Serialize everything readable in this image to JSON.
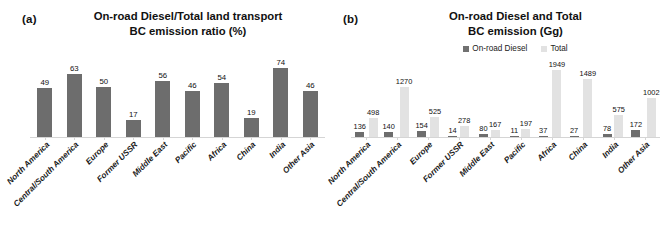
{
  "figure": {
    "panels": [
      {
        "panel_label": "(a)",
        "title_line1": "On-road Diesel/Total land transport",
        "title_line2": "BC emission ratio (%)"
      },
      {
        "panel_label": "(b)",
        "title_line1": "On-road Diesel and Total",
        "title_line2": "BC emission (Gg)"
      }
    ]
  },
  "legend": {
    "items": [
      {
        "label": "On-road Diesel",
        "color": "#717171",
        "icon": "legend-square-icon"
      },
      {
        "label": "Total",
        "color": "#e2e2e2",
        "icon": "legend-square-icon"
      }
    ]
  },
  "colors": {
    "diesel_bar": "#6d6d6d",
    "total_bar": "#e2e2e2",
    "axis": "#d5d5d5",
    "text": "#111111",
    "background": "#ffffff"
  },
  "chart_data": [
    {
      "type": "bar",
      "panel": "(a)",
      "title": "On-road Diesel/Total land transport BC emission ratio (%)",
      "xlabel": "",
      "ylabel": "",
      "ylim": [
        0,
        80
      ],
      "grid": false,
      "legend_position": "none",
      "categories": [
        "North America",
        "Central/South America",
        "Europe",
        "Former USSR",
        "Middle East",
        "Pacific",
        "Africa",
        "China",
        "India",
        "Other Asia"
      ],
      "values": [
        49,
        63,
        50,
        17,
        56,
        46,
        54,
        19,
        74,
        46
      ],
      "data_labels": [
        "49",
        "63",
        "50",
        "17",
        "56",
        "46",
        "54",
        "19",
        "74",
        "46"
      ]
    },
    {
      "type": "bar",
      "panel": "(b)",
      "title": "On-road Diesel and Total BC emission (Gg)",
      "xlabel": "",
      "ylabel": "",
      "ylim": [
        0,
        2000
      ],
      "grid": false,
      "legend_position": "top",
      "categories": [
        "North America",
        "Central/South America",
        "Europe",
        "Former USSR",
        "Middle East",
        "Pacific",
        "Africa",
        "China",
        "India",
        "Other Asia"
      ],
      "series": [
        {
          "name": "On-road Diesel",
          "values": [
            136,
            140,
            154,
            14,
            80,
            11,
            37,
            27,
            78,
            172
          ],
          "data_labels": [
            "136",
            "140",
            "154",
            "14",
            "80",
            "11",
            "37",
            "27",
            "78",
            "172"
          ]
        },
        {
          "name": "Total",
          "values": [
            498,
            1270,
            525,
            278,
            167,
            197,
            1949,
            1489,
            575,
            1002
          ],
          "data_labels": [
            "498",
            "1270",
            "525",
            "278",
            "167",
            "197",
            "1949",
            "1489",
            "575",
            "1002"
          ]
        }
      ]
    }
  ]
}
